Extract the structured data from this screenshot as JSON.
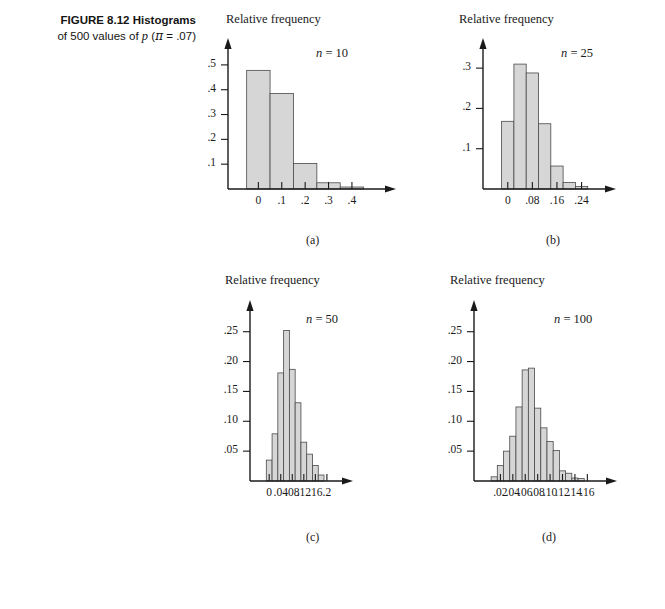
{
  "figure": {
    "label": "FIGURE 8.12",
    "title_part1": "Histograms",
    "title_part2": "of 500 values of",
    "title_var": "p",
    "title_paren_open": "(",
    "title_pi": "π",
    "title_eq": "=",
    "title_value": ".07)"
  },
  "common": {
    "y_axis_title": "Relative frequency",
    "n_prefix": "n",
    "n_eq": " = "
  },
  "chart_data": [
    {
      "id": "a",
      "panel_label": "(a)",
      "type": "bar",
      "title": "",
      "n_label": "n = 10",
      "n_value": "10",
      "xlabel": "",
      "ylabel": "Relative frequency",
      "bin_width": 0.1,
      "xlim": [
        -0.07,
        0.52
      ],
      "ylim": [
        0,
        0.56
      ],
      "x_ticks": [
        0,
        0.1,
        0.2,
        0.3,
        0.4
      ],
      "x_tick_labels": [
        "0",
        ".1",
        ".2",
        ".3",
        ".4"
      ],
      "y_ticks": [
        0.1,
        0.2,
        0.3,
        0.4,
        0.5
      ],
      "y_tick_labels": [
        ".1",
        ".2",
        ".3",
        ".4",
        ".5"
      ],
      "centers": [
        0,
        0.1,
        0.2,
        0.3,
        0.4
      ],
      "values": [
        0.478,
        0.385,
        0.103,
        0.025,
        0.008
      ],
      "grid": false,
      "legend": "none"
    },
    {
      "id": "b",
      "panel_label": "(b)",
      "type": "bar",
      "title": "",
      "n_label": "n = 25",
      "n_value": "25",
      "xlabel": "",
      "ylabel": "Relative frequency",
      "bin_width": 0.04,
      "xlim": [
        -0.035,
        0.3
      ],
      "ylim": [
        0,
        0.345
      ],
      "x_ticks": [
        0,
        0.08,
        0.16,
        0.24
      ],
      "x_tick_labels": [
        "0",
        ".08",
        ".16",
        ".24"
      ],
      "y_ticks": [
        0.1,
        0.2,
        0.3
      ],
      "y_tick_labels": [
        ".1",
        ".2",
        ".3"
      ],
      "centers": [
        0.0,
        0.04,
        0.08,
        0.12,
        0.16,
        0.2,
        0.24
      ],
      "values": [
        0.168,
        0.31,
        0.288,
        0.162,
        0.057,
        0.016,
        0.006
      ],
      "grid": false,
      "legend": "none"
    },
    {
      "id": "c",
      "panel_label": "(c)",
      "type": "bar",
      "title": "",
      "n_label": "n = 50",
      "n_value": "50",
      "xlabel": "",
      "ylabel": "Relative frequency",
      "bin_width": 0.02,
      "xlim": [
        -0.018,
        0.235
      ],
      "ylim": [
        0,
        0.283
      ],
      "x_ticks": [
        0,
        0.04,
        0.08,
        0.12,
        0.16,
        0.2
      ],
      "x_tick_labels": [
        "0",
        ".04",
        ".08",
        ".12",
        ".16",
        ".2"
      ],
      "y_ticks": [
        0.05,
        0.1,
        0.15,
        0.2,
        0.25
      ],
      "y_tick_labels": [
        ".05",
        ".10",
        ".15",
        ".20",
        ".25"
      ],
      "centers": [
        0.0,
        0.02,
        0.04,
        0.06,
        0.08,
        0.1,
        0.12,
        0.14,
        0.16,
        0.18
      ],
      "values": [
        0.035,
        0.079,
        0.181,
        0.252,
        0.187,
        0.131,
        0.065,
        0.045,
        0.026,
        0.01
      ],
      "grid": false,
      "legend": "none"
    },
    {
      "id": "d",
      "panel_label": "(d)",
      "type": "bar",
      "title": "",
      "n_label": "n = 100",
      "n_value": "100",
      "xlabel": "",
      "ylabel": "Relative frequency",
      "bin_width": 0.01,
      "xlim": [
        0.0,
        0.182
      ],
      "ylim": [
        0,
        0.283
      ],
      "x_ticks": [
        0.02,
        0.04,
        0.06,
        0.08,
        0.1,
        0.12,
        0.14,
        0.16
      ],
      "x_tick_labels": [
        ".02",
        ".04",
        ".06",
        ".08",
        ".10",
        ".12",
        ".14",
        ".16"
      ],
      "y_ticks": [
        0.05,
        0.1,
        0.15,
        0.2,
        0.25
      ],
      "y_tick_labels": [
        ".05",
        ".10",
        ".15",
        ".20",
        ".25"
      ],
      "centers": [
        0.01,
        0.02,
        0.03,
        0.04,
        0.05,
        0.06,
        0.07,
        0.08,
        0.09,
        0.1,
        0.11,
        0.12,
        0.13,
        0.14,
        0.15
      ],
      "values": [
        0.007,
        0.026,
        0.05,
        0.075,
        0.124,
        0.186,
        0.189,
        0.122,
        0.089,
        0.066,
        0.051,
        0.017,
        0.013,
        0.005,
        0.004
      ],
      "grid": false,
      "legend": "none"
    }
  ],
  "panels_layout": [
    {
      "id": "a",
      "left": 196,
      "top": 28,
      "width": 210,
      "height": 185,
      "title_left": 30,
      "title_top": -16,
      "n_left": 120,
      "n_top": 18,
      "label_left": 110,
      "label_top": 205
    },
    {
      "id": "b",
      "left": 451,
      "top": 28,
      "width": 175,
      "height": 185,
      "title_left": 8,
      "title_top": -16,
      "n_left": 110,
      "n_top": 18,
      "label_left": 95,
      "label_top": 205
    },
    {
      "id": "c",
      "left": 218,
      "top": 290,
      "width": 145,
      "height": 215,
      "title_left": 7,
      "title_top": -17,
      "n_left": 88,
      "n_top": 22,
      "label_left": 88,
      "label_top": 240
    },
    {
      "id": "d",
      "left": 442,
      "top": 290,
      "width": 185,
      "height": 215,
      "title_left": 8,
      "title_top": -17,
      "n_left": 112,
      "n_top": 22,
      "label_left": 100,
      "label_top": 240
    }
  ]
}
